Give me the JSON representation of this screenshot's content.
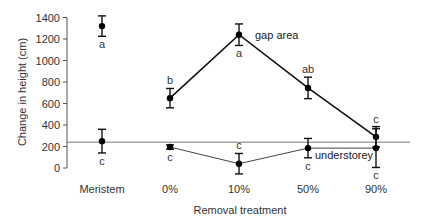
{
  "chart_data": {
    "type": "line",
    "title": "",
    "xlabel": "Removal treatment",
    "ylabel": "Change in height (cm)",
    "ylim": [
      0,
      1400
    ],
    "yticks": [
      0,
      200,
      400,
      600,
      800,
      1000,
      1200,
      1400
    ],
    "categories": [
      "Meristem",
      "0%",
      "10%",
      "50%",
      "90%"
    ],
    "grid": false,
    "legend": "inline labels",
    "reference_line": {
      "y": 240,
      "description": "horizontal reference line"
    },
    "series": [
      {
        "name": "gap area",
        "label_pos": "right of 10% point",
        "connected_from_index": 1,
        "values": [
          1320,
          650,
          1240,
          745,
          290
        ],
        "error": [
          95,
          90,
          100,
          100,
          95
        ],
        "significance": [
          "a",
          "b",
          "a",
          "ab",
          "c"
        ],
        "sig_position": [
          "below",
          "above",
          "below",
          "above",
          "above"
        ]
      },
      {
        "name": "understorey",
        "label_pos": "right of 50% point",
        "connected_from_index": 1,
        "values": [
          250,
          195,
          40,
          185,
          185
        ],
        "error": [
          110,
          20,
          95,
          90,
          180
        ],
        "significance": [
          "c",
          "c",
          "c",
          "c",
          "c"
        ],
        "sig_position": [
          "below",
          "below",
          "above",
          "below",
          "below"
        ]
      }
    ]
  },
  "axis": {
    "ylabel": "Change in height (cm)",
    "xlabel": "Removal treatment"
  }
}
